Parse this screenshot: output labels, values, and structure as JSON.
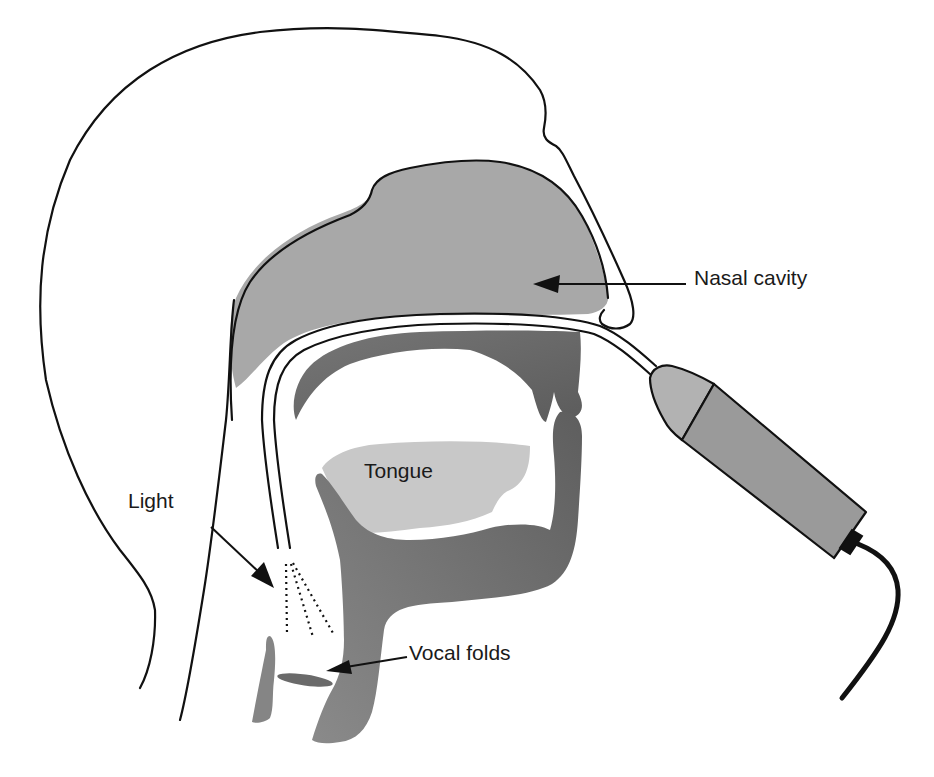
{
  "diagram": {
    "labels": {
      "nasal_cavity": "Nasal cavity",
      "tongue": "Tongue",
      "light": "Light",
      "vocal_folds": "Vocal folds"
    },
    "structures": [
      "head-outline",
      "nasal-cavity",
      "oral-palate",
      "tongue",
      "pharynx-larynx",
      "vocal-folds",
      "endoscope-tube",
      "endoscope-eyepiece",
      "endoscope-handle",
      "endoscope-cable",
      "light-beam"
    ],
    "colors": {
      "outline": "#111111",
      "nasal_cavity_fill": "#a8a8a8",
      "tongue_fill": "#c8c8c8",
      "tissue_dark_fill": "#6e6e6e",
      "tissue_mid_fill": "#7c7c7c",
      "endoscope_tip_fill": "#b2b2b2",
      "endoscope_body_fill": "#9a9a9a",
      "background": "#ffffff"
    }
  }
}
